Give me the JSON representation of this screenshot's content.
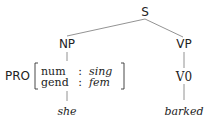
{
  "tree": {
    "root": "S",
    "np": {
      "label": "NP",
      "child": {
        "label": "PRO",
        "features": [
          {
            "name": "num",
            "sep": ":",
            "value": "sing"
          },
          {
            "name": "gend",
            "sep": ":",
            "value": "fem"
          }
        ],
        "word": "she"
      }
    },
    "vp": {
      "label": "VP",
      "child": {
        "label": "V0",
        "word": "barked"
      }
    }
  }
}
